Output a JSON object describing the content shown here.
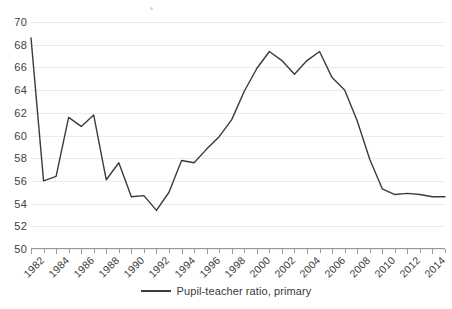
{
  "chart_data": {
    "type": "line",
    "title": "",
    "xlabel": "",
    "ylabel": "",
    "ylim": [
      50,
      70
    ],
    "ytick_step": 2,
    "yticks": [
      50,
      52,
      54,
      56,
      58,
      60,
      62,
      64,
      66,
      68,
      70
    ],
    "ytick_labels": [
      "50",
      "52",
      "54",
      "56",
      "58",
      "60",
      "62",
      "64",
      "66",
      "68",
      "70"
    ],
    "xlim": [
      1982,
      2015
    ],
    "xticks_all": [
      1982,
      1983,
      1984,
      1985,
      1986,
      1987,
      1988,
      1989,
      1990,
      1991,
      1992,
      1993,
      1994,
      1995,
      1996,
      1997,
      1998,
      1999,
      2000,
      2001,
      2002,
      2003,
      2004,
      2005,
      2006,
      2007,
      2008,
      2009,
      2010,
      2011,
      2012,
      2013,
      2014,
      2015
    ],
    "xtick_labels": [
      "1982",
      "1984",
      "1986",
      "1988",
      "1990",
      "1992",
      "1994",
      "1996",
      "1998",
      "2000",
      "2002",
      "2004",
      "2006",
      "2008",
      "2010",
      "2012",
      "2014"
    ],
    "xtick_label_years": [
      1982,
      1984,
      1986,
      1988,
      1990,
      1992,
      1994,
      1996,
      1998,
      2000,
      2002,
      2004,
      2006,
      2008,
      2010,
      2012,
      2014
    ],
    "grid": true,
    "grid_axis": "y",
    "legend_position": "bottom",
    "line_color": "#3b3b3b",
    "grid_color": "#ececed",
    "axis_color": "#9a9a9a",
    "text_color": "#404040",
    "series": [
      {
        "name": "Pupil-teacher ratio, primary",
        "x": [
          1982,
          1983,
          1984,
          1985,
          1986,
          1987,
          1988,
          1989,
          1990,
          1991,
          1992,
          1993,
          1994,
          1995,
          1996,
          1997,
          1998,
          1999,
          2000,
          2001,
          2002,
          2003,
          2004,
          2005,
          2006,
          2007,
          2008,
          2009,
          2010,
          2011,
          2012,
          2013,
          2014,
          2015
        ],
        "values": [
          68.6,
          56.0,
          56.4,
          61.6,
          60.8,
          61.8,
          56.1,
          57.6,
          54.6,
          54.7,
          53.4,
          55.0,
          57.8,
          57.6,
          58.8,
          59.9,
          61.4,
          63.9,
          65.9,
          67.4,
          66.6,
          65.4,
          66.6,
          67.4,
          65.1,
          64.0,
          61.3,
          57.9,
          55.3,
          54.8,
          54.9,
          54.8,
          54.6,
          54.6
        ]
      }
    ]
  },
  "legend": {
    "items": [
      {
        "label": "Pupil-teacher ratio, primary",
        "color": "#3b3b3b"
      }
    ]
  }
}
